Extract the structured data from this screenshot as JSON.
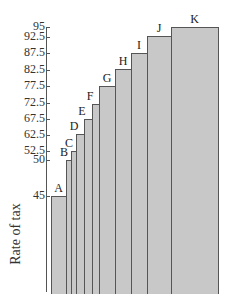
{
  "chart_data": {
    "type": "bar",
    "title": "",
    "xlabel": "",
    "ylabel": "Rate of tax",
    "categories": [
      "A",
      "B",
      "C",
      "D",
      "E",
      "F",
      "G",
      "H",
      "I",
      "J",
      "K"
    ],
    "values": [
      45,
      50,
      52.5,
      62.5,
      67.5,
      72.5,
      77.5,
      82.5,
      87.5,
      92.5,
      95
    ],
    "y_tick_labels": [
      "95",
      "92.5",
      "87.5",
      "82.5",
      "77.5",
      "72.5",
      "67.5",
      "62.5",
      "52.5",
      "50",
      "45"
    ],
    "grid": false,
    "legend": null,
    "bar_color": "#c8c8c8",
    "edge_color": "#555555",
    "layout": {
      "tick_y_px": [
        27,
        37,
        53,
        70,
        86,
        103,
        119,
        135,
        151,
        160,
        196
      ],
      "bar_left_px": [
        51,
        66,
        71,
        76,
        84,
        92,
        99,
        115,
        131,
        147,
        171
      ],
      "bar_right_px": [
        66,
        71,
        76,
        84,
        92,
        99,
        115,
        131,
        147,
        171,
        218
      ],
      "bar_top_px": [
        196,
        160,
        151,
        134,
        119,
        104,
        86,
        69,
        53,
        36,
        27
      ]
    }
  }
}
